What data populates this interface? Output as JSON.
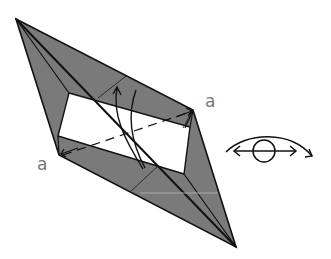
{
  "diagram": {
    "type": "origami-step",
    "colors": {
      "paper_colored": "#7a7a7a",
      "paper_white": "#ffffff",
      "line": "#111111",
      "label": "#777777"
    },
    "labels": {
      "point_a_right": "a",
      "point_a_left": "a"
    },
    "symbols": {
      "fold_arrows": "curved-arrows-icon",
      "view_symbol": "eye-rotate-icon"
    }
  }
}
